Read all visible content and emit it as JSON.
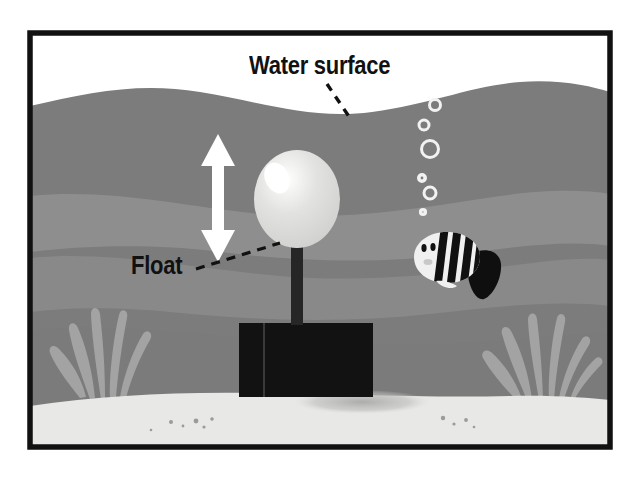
{
  "illustration": {
    "title": "Underwater float anchored to the seabed",
    "type": "science-diagram",
    "frame": {
      "x": 27,
      "y": 30,
      "width": 586,
      "height": 420,
      "border_px": 5,
      "border_color": "#111111"
    }
  },
  "labels": [
    {
      "id": "water-surface",
      "text": "Water surface",
      "x": 249,
      "y": 51,
      "font_size": 25,
      "color": "#111111",
      "leader": {
        "style": "dashed",
        "from": [
          327,
          86
        ],
        "to": [
          348,
          117
        ]
      }
    },
    {
      "id": "float",
      "text": "Float",
      "x": 131,
      "y": 251,
      "font_size": 25,
      "color": "#111111",
      "leader": {
        "style": "dashed",
        "from": [
          196,
          268
        ],
        "to": [
          277,
          245
        ]
      }
    }
  ],
  "colors": {
    "paper": "#ffffff",
    "frame": "#111111",
    "water_top": "#7c7c7c",
    "water_band_light": "#949494",
    "water_band_mid": "#8a8a8a",
    "water_deep": "#828282",
    "sand": "#e8e8e6",
    "sand_shadow": "#b9b9b7",
    "float_body": "#dcdcdc",
    "float_highlight": "#ffffff",
    "post": "#262626",
    "block": "#121212",
    "seaweed": "#a3a3a3",
    "arrow": "#ffffff",
    "bubble": "#f2f2f2",
    "fish_body": "#f0f0f0",
    "fish_stripes": "#111111"
  },
  "objects": {
    "water_surface_wave": {
      "description": "gentle sine wave separating white sky from gray water",
      "baseline_y": 96,
      "amplitude": 14
    },
    "float": {
      "label": "Float",
      "shape": "balloon-ellipse",
      "cx": 297,
      "cy": 199,
      "rx": 42,
      "ry": 48,
      "highlight": {
        "cx": 277,
        "cy": 178,
        "rx": 13,
        "ry": 17,
        "rotate": -25
      }
    },
    "post": {
      "x": 291,
      "y": 247,
      "width": 12,
      "height": 78
    },
    "anchor_block": {
      "x": 239,
      "y": 323,
      "width": 134,
      "height": 74,
      "edge_line_x": 264
    },
    "block_shadow": {
      "cx": 362,
      "cy": 402,
      "rx": 68,
      "ry": 12
    },
    "motion_arrow": {
      "orientation": "vertical-double-headed",
      "x": 218,
      "top_y": 137,
      "bottom_y": 260,
      "color": "#ffffff"
    },
    "bubbles": [
      {
        "cx": 435,
        "cy": 105,
        "r": 5.5
      },
      {
        "cx": 424,
        "cy": 125,
        "r": 5.0
      },
      {
        "cx": 430,
        "cy": 149,
        "r": 8.5
      },
      {
        "cx": 422,
        "cy": 178,
        "r": 3.8
      },
      {
        "cx": 430,
        "cy": 193,
        "r": 6.0
      },
      {
        "cx": 423,
        "cy": 212,
        "r": 3.0
      }
    ],
    "fish": {
      "cx": 447,
      "cy": 258,
      "facing": "left",
      "body_rx": 33,
      "body_ry": 22,
      "stripe_count": 4,
      "eyes": 2,
      "tail": "black-fan"
    },
    "seaweed": [
      {
        "id": "seaweed-left",
        "x": 84,
        "y": 395,
        "blades": 5
      },
      {
        "id": "seaweed-right",
        "x": 520,
        "y": 397,
        "blades": 6
      }
    ],
    "pebbles": [
      {
        "cx": 171,
        "cy": 422,
        "r": 2.0
      },
      {
        "cx": 183,
        "cy": 426,
        "r": 1.4
      },
      {
        "cx": 196,
        "cy": 421,
        "r": 2.4
      },
      {
        "cx": 204,
        "cy": 427,
        "r": 1.6
      },
      {
        "cx": 212,
        "cy": 419,
        "r": 1.8
      },
      {
        "cx": 151,
        "cy": 430,
        "r": 1.3
      },
      {
        "cx": 443,
        "cy": 418,
        "r": 2.2
      },
      {
        "cx": 454,
        "cy": 424,
        "r": 1.6
      },
      {
        "cx": 466,
        "cy": 420,
        "r": 1.9
      },
      {
        "cx": 474,
        "cy": 427,
        "r": 1.3
      }
    ]
  }
}
